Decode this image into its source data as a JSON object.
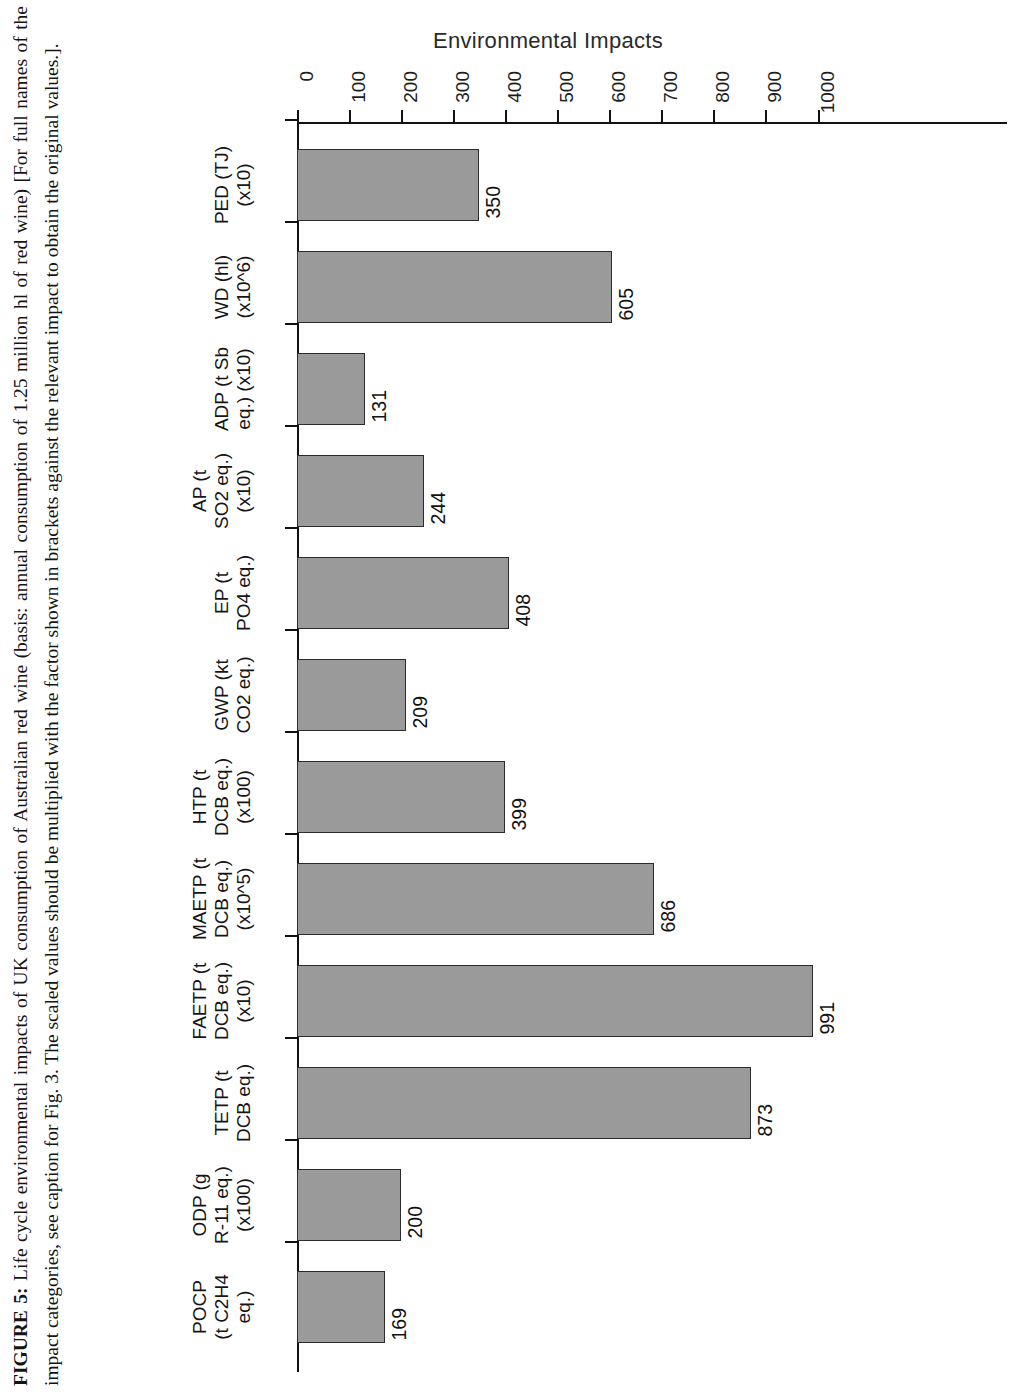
{
  "figure": {
    "caption_label": "FIGURE 5:",
    "caption_text": " Life cycle environmental impacts of UK consumption of Australian red wine (basis: annual consumption of 1.25 million hl of red wine) [For full names of the impact categories, see caption for Fig. 3. The scaled values should be multiplied with the factor shown in brackets against the relevant impact to obtain the original values.]."
  },
  "chart_data": {
    "type": "bar",
    "title": "",
    "xlabel": "",
    "ylabel": "Environmental Impacts",
    "ylim": [
      0,
      1000
    ],
    "grid": false,
    "legend": "none",
    "orientation": "vertical-bars-rotated-90",
    "tick_labels": [
      "0",
      "100",
      "200",
      "300",
      "400",
      "500",
      "600",
      "700",
      "800",
      "900",
      "1000"
    ],
    "ticks": [
      0,
      100,
      200,
      300,
      400,
      500,
      600,
      700,
      800,
      900,
      1000
    ],
    "categories": [
      "PED (TJ)\n(x10)",
      "WD (hl)\n(x10^6)",
      "ADP (t Sb\neq.) (x10)",
      "AP (t\nSO2 eq.)\n(x10)",
      "EP (t\nPO4 eq.)",
      "GWP (kt\nCO2 eq.)",
      "HTP (t\nDCB eq.)\n(x100)",
      "MAETP (t\nDCB eq.)\n(x10^5)",
      "FAETP (t\nDCB eq.)\n(x10)",
      "TETP (t\nDCB eq.)",
      "ODP (g\nR-11 eq.)\n(x100)",
      "POCP\n(t C2H4\neq.)"
    ],
    "values": [
      350,
      605,
      131,
      244,
      408,
      209,
      399,
      686,
      991,
      873,
      200,
      169
    ],
    "data_labels": [
      "350",
      "605",
      "131",
      "244",
      "408",
      "209",
      "399",
      "686",
      "991",
      "873",
      "200",
      "169"
    ],
    "colors": {
      "bar_fill": "#9a9a9a",
      "bar_stroke": "#2b2b2b",
      "axis": "#111111",
      "text": "#151515",
      "background": "#ffffff"
    }
  },
  "axis": {
    "value_axis_title": "Environmental Impacts"
  }
}
